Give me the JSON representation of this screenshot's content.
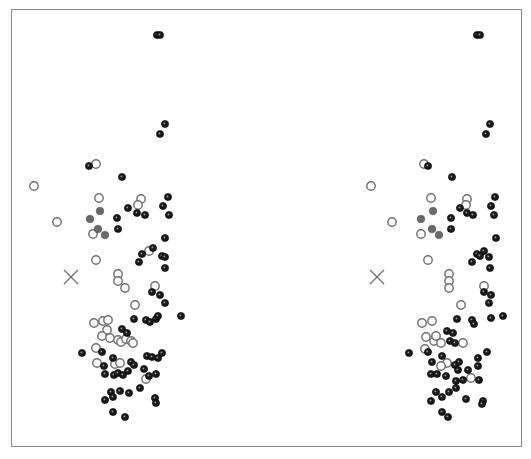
{
  "figure": {
    "type": "stereo-pair-scatter",
    "frame_color": "#8a8a8a",
    "colors": {
      "filled": "#1a1a1a",
      "open": "#6e6e6e",
      "gray": "#6a6a6a",
      "cross": "#707070"
    },
    "views": [
      {
        "name": "left-view",
        "cross": [
          71,
          277
        ],
        "points": [
          {
            "x": 157,
            "y": 35,
            "t": "f"
          },
          {
            "x": 160,
            "y": 35,
            "t": "f"
          },
          {
            "x": 165,
            "y": 124,
            "t": "f"
          },
          {
            "x": 160,
            "y": 134,
            "t": "f"
          },
          {
            "x": 89,
            "y": 166,
            "t": "f"
          },
          {
            "x": 96,
            "y": 164,
            "t": "o"
          },
          {
            "x": 122,
            "y": 177,
            "t": "f"
          },
          {
            "x": 34,
            "y": 186,
            "t": "o"
          },
          {
            "x": 99,
            "y": 198,
            "t": "o"
          },
          {
            "x": 141,
            "y": 199,
            "t": "o"
          },
          {
            "x": 138,
            "y": 205,
            "t": "o"
          },
          {
            "x": 168,
            "y": 197,
            "t": "f"
          },
          {
            "x": 163,
            "y": 206,
            "t": "f"
          },
          {
            "x": 169,
            "y": 215,
            "t": "f"
          },
          {
            "x": 128,
            "y": 208,
            "t": "f"
          },
          {
            "x": 137,
            "y": 213,
            "t": "f"
          },
          {
            "x": 145,
            "y": 215,
            "t": "f"
          },
          {
            "x": 100,
            "y": 211,
            "t": "g"
          },
          {
            "x": 90,
            "y": 219,
            "t": "g"
          },
          {
            "x": 117,
            "y": 218,
            "t": "f"
          },
          {
            "x": 57,
            "y": 222,
            "t": "o"
          },
          {
            "x": 98,
            "y": 229,
            "t": "g"
          },
          {
            "x": 105,
            "y": 235,
            "t": "g"
          },
          {
            "x": 93,
            "y": 234,
            "t": "o"
          },
          {
            "x": 118,
            "y": 229,
            "t": "f"
          },
          {
            "x": 165,
            "y": 238,
            "t": "f"
          },
          {
            "x": 142,
            "y": 254,
            "t": "f"
          },
          {
            "x": 149,
            "y": 251,
            "t": "o"
          },
          {
            "x": 153,
            "y": 248,
            "t": "f"
          },
          {
            "x": 162,
            "y": 256,
            "t": "f"
          },
          {
            "x": 165,
            "y": 257,
            "t": "f"
          },
          {
            "x": 139,
            "y": 262,
            "t": "f"
          },
          {
            "x": 165,
            "y": 268,
            "t": "f"
          },
          {
            "x": 96,
            "y": 260,
            "t": "o"
          },
          {
            "x": 118,
            "y": 274,
            "t": "o"
          },
          {
            "x": 118,
            "y": 281,
            "t": "o"
          },
          {
            "x": 125,
            "y": 288,
            "t": "o"
          },
          {
            "x": 155,
            "y": 286,
            "t": "o"
          },
          {
            "x": 152,
            "y": 292,
            "t": "f"
          },
          {
            "x": 160,
            "y": 295,
            "t": "f"
          },
          {
            "x": 165,
            "y": 303,
            "t": "f"
          },
          {
            "x": 135,
            "y": 305,
            "t": "o"
          },
          {
            "x": 94,
            "y": 323,
            "t": "o"
          },
          {
            "x": 103,
            "y": 321,
            "t": "o"
          },
          {
            "x": 108,
            "y": 320,
            "t": "o"
          },
          {
            "x": 134,
            "y": 319,
            "t": "f"
          },
          {
            "x": 146,
            "y": 320,
            "t": "f"
          },
          {
            "x": 150,
            "y": 322,
            "t": "f"
          },
          {
            "x": 156,
            "y": 319,
            "t": "f"
          },
          {
            "x": 158,
            "y": 316,
            "t": "f"
          },
          {
            "x": 181,
            "y": 316,
            "t": "f"
          },
          {
            "x": 122,
            "y": 329,
            "t": "f"
          },
          {
            "x": 127,
            "y": 333,
            "t": "f"
          },
          {
            "x": 107,
            "y": 330,
            "t": "o"
          },
          {
            "x": 102,
            "y": 336,
            "t": "o"
          },
          {
            "x": 110,
            "y": 338,
            "t": "o"
          },
          {
            "x": 118,
            "y": 340,
            "t": "o"
          },
          {
            "x": 121,
            "y": 342,
            "t": "o"
          },
          {
            "x": 126,
            "y": 339,
            "t": "o"
          },
          {
            "x": 131,
            "y": 341,
            "t": "o"
          },
          {
            "x": 133,
            "y": 343,
            "t": "o"
          },
          {
            "x": 96,
            "y": 348,
            "t": "o"
          },
          {
            "x": 102,
            "y": 352,
            "t": "f"
          },
          {
            "x": 82,
            "y": 353,
            "t": "f"
          },
          {
            "x": 113,
            "y": 358,
            "t": "f"
          },
          {
            "x": 147,
            "y": 356,
            "t": "f"
          },
          {
            "x": 152,
            "y": 357,
            "t": "f"
          },
          {
            "x": 158,
            "y": 358,
            "t": "f"
          },
          {
            "x": 162,
            "y": 353,
            "t": "f"
          },
          {
            "x": 97,
            "y": 363,
            "t": "o"
          },
          {
            "x": 104,
            "y": 366,
            "t": "f"
          },
          {
            "x": 115,
            "y": 364,
            "t": "o"
          },
          {
            "x": 120,
            "y": 363,
            "t": "o"
          },
          {
            "x": 131,
            "y": 362,
            "t": "f"
          },
          {
            "x": 134,
            "y": 365,
            "t": "f"
          },
          {
            "x": 144,
            "y": 369,
            "t": "f"
          },
          {
            "x": 149,
            "y": 376,
            "t": "f"
          },
          {
            "x": 146,
            "y": 379,
            "t": "o"
          },
          {
            "x": 105,
            "y": 374,
            "t": "f"
          },
          {
            "x": 114,
            "y": 375,
            "t": "f"
          },
          {
            "x": 118,
            "y": 373,
            "t": "f"
          },
          {
            "x": 128,
            "y": 371,
            "t": "f"
          },
          {
            "x": 123,
            "y": 375,
            "t": "f"
          },
          {
            "x": 156,
            "y": 374,
            "t": "f"
          },
          {
            "x": 111,
            "y": 392,
            "t": "f"
          },
          {
            "x": 120,
            "y": 391,
            "t": "f"
          },
          {
            "x": 113,
            "y": 397,
            "t": "f"
          },
          {
            "x": 105,
            "y": 400,
            "t": "f"
          },
          {
            "x": 129,
            "y": 393,
            "t": "f"
          },
          {
            "x": 140,
            "y": 388,
            "t": "f"
          },
          {
            "x": 155,
            "y": 398,
            "t": "f"
          },
          {
            "x": 156,
            "y": 403,
            "t": "f"
          },
          {
            "x": 113,
            "y": 412,
            "t": "f"
          },
          {
            "x": 125,
            "y": 417,
            "t": "f"
          }
        ]
      },
      {
        "name": "right-view",
        "cross": [
          377,
          277
        ],
        "points": [
          {
            "x": 477,
            "y": 35,
            "t": "f"
          },
          {
            "x": 480,
            "y": 35,
            "t": "f"
          },
          {
            "x": 490,
            "y": 124,
            "t": "f"
          },
          {
            "x": 486,
            "y": 134,
            "t": "f"
          },
          {
            "x": 424,
            "y": 164,
            "t": "o"
          },
          {
            "x": 428,
            "y": 166,
            "t": "f"
          },
          {
            "x": 452,
            "y": 177,
            "t": "f"
          },
          {
            "x": 371,
            "y": 186,
            "t": "o"
          },
          {
            "x": 431,
            "y": 198,
            "t": "o"
          },
          {
            "x": 467,
            "y": 199,
            "t": "o"
          },
          {
            "x": 466,
            "y": 205,
            "t": "o"
          },
          {
            "x": 495,
            "y": 197,
            "t": "f"
          },
          {
            "x": 491,
            "y": 206,
            "t": "f"
          },
          {
            "x": 494,
            "y": 215,
            "t": "f"
          },
          {
            "x": 460,
            "y": 208,
            "t": "f"
          },
          {
            "x": 467,
            "y": 213,
            "t": "f"
          },
          {
            "x": 473,
            "y": 215,
            "t": "f"
          },
          {
            "x": 433,
            "y": 211,
            "t": "g"
          },
          {
            "x": 421,
            "y": 219,
            "t": "g"
          },
          {
            "x": 451,
            "y": 218,
            "t": "f"
          },
          {
            "x": 392,
            "y": 222,
            "t": "o"
          },
          {
            "x": 432,
            "y": 229,
            "t": "g"
          },
          {
            "x": 439,
            "y": 235,
            "t": "g"
          },
          {
            "x": 421,
            "y": 234,
            "t": "o"
          },
          {
            "x": 451,
            "y": 229,
            "t": "f"
          },
          {
            "x": 496,
            "y": 238,
            "t": "f"
          },
          {
            "x": 477,
            "y": 254,
            "t": "f"
          },
          {
            "x": 484,
            "y": 251,
            "t": "f"
          },
          {
            "x": 480,
            "y": 256,
            "t": "f"
          },
          {
            "x": 489,
            "y": 257,
            "t": "f"
          },
          {
            "x": 472,
            "y": 262,
            "t": "f"
          },
          {
            "x": 490,
            "y": 268,
            "t": "f"
          },
          {
            "x": 428,
            "y": 260,
            "t": "o"
          },
          {
            "x": 449,
            "y": 274,
            "t": "o"
          },
          {
            "x": 449,
            "y": 281,
            "t": "o"
          },
          {
            "x": 449,
            "y": 288,
            "t": "o"
          },
          {
            "x": 484,
            "y": 286,
            "t": "o"
          },
          {
            "x": 484,
            "y": 292,
            "t": "f"
          },
          {
            "x": 491,
            "y": 295,
            "t": "f"
          },
          {
            "x": 489,
            "y": 303,
            "t": "f"
          },
          {
            "x": 461,
            "y": 305,
            "t": "o"
          },
          {
            "x": 422,
            "y": 323,
            "t": "o"
          },
          {
            "x": 432,
            "y": 321,
            "t": "o"
          },
          {
            "x": 457,
            "y": 319,
            "t": "f"
          },
          {
            "x": 472,
            "y": 320,
            "t": "f"
          },
          {
            "x": 474,
            "y": 324,
            "t": "f"
          },
          {
            "x": 491,
            "y": 318,
            "t": "f"
          },
          {
            "x": 503,
            "y": 316,
            "t": "f"
          },
          {
            "x": 447,
            "y": 331,
            "t": "f"
          },
          {
            "x": 453,
            "y": 333,
            "t": "f"
          },
          {
            "x": 426,
            "y": 337,
            "t": "o"
          },
          {
            "x": 434,
            "y": 341,
            "t": "o"
          },
          {
            "x": 436,
            "y": 336,
            "t": "o"
          },
          {
            "x": 441,
            "y": 343,
            "t": "o"
          },
          {
            "x": 450,
            "y": 341,
            "t": "f"
          },
          {
            "x": 455,
            "y": 343,
            "t": "f"
          },
          {
            "x": 463,
            "y": 343,
            "t": "o"
          },
          {
            "x": 425,
            "y": 349,
            "t": "o"
          },
          {
            "x": 428,
            "y": 352,
            "t": "f"
          },
          {
            "x": 409,
            "y": 353,
            "t": "f"
          },
          {
            "x": 442,
            "y": 356,
            "t": "f"
          },
          {
            "x": 478,
            "y": 358,
            "t": "f"
          },
          {
            "x": 487,
            "y": 352,
            "t": "f"
          },
          {
            "x": 432,
            "y": 362,
            "t": "f"
          },
          {
            "x": 447,
            "y": 363,
            "t": "o"
          },
          {
            "x": 441,
            "y": 366,
            "t": "o"
          },
          {
            "x": 459,
            "y": 362,
            "t": "f"
          },
          {
            "x": 455,
            "y": 365,
            "t": "f"
          },
          {
            "x": 458,
            "y": 370,
            "t": "f"
          },
          {
            "x": 468,
            "y": 370,
            "t": "f"
          },
          {
            "x": 471,
            "y": 378,
            "t": "o"
          },
          {
            "x": 431,
            "y": 374,
            "t": "f"
          },
          {
            "x": 437,
            "y": 374,
            "t": "f"
          },
          {
            "x": 446,
            "y": 376,
            "t": "f"
          },
          {
            "x": 456,
            "y": 381,
            "t": "f"
          },
          {
            "x": 463,
            "y": 380,
            "t": "f"
          },
          {
            "x": 478,
            "y": 366,
            "t": "f"
          },
          {
            "x": 479,
            "y": 380,
            "t": "f"
          },
          {
            "x": 436,
            "y": 392,
            "t": "f"
          },
          {
            "x": 449,
            "y": 392,
            "t": "f"
          },
          {
            "x": 456,
            "y": 388,
            "t": "f"
          },
          {
            "x": 442,
            "y": 397,
            "t": "f"
          },
          {
            "x": 431,
            "y": 401,
            "t": "f"
          },
          {
            "x": 466,
            "y": 399,
            "t": "f"
          },
          {
            "x": 483,
            "y": 401,
            "t": "f"
          },
          {
            "x": 482,
            "y": 404,
            "t": "f"
          },
          {
            "x": 442,
            "y": 412,
            "t": "f"
          },
          {
            "x": 448,
            "y": 417,
            "t": "f"
          }
        ]
      }
    ]
  }
}
